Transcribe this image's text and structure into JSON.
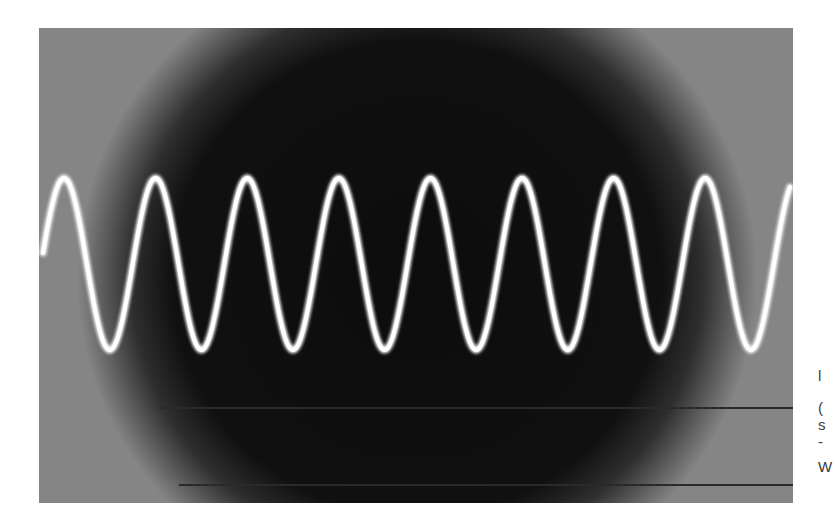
{
  "figure": {
    "type": "oscilloscope-photo",
    "colors": {
      "screen_center": "#0d0d0d",
      "screen_edge": "#828282",
      "trace": "#ffffff",
      "page_bg": "#ffffff"
    },
    "waveform": {
      "cycles_visible": 8.2,
      "period_px": 91.6,
      "peak_y_px": 178,
      "trough_y_px": 350,
      "first_peak_x_px": 64
    }
  },
  "caption_fragments": [
    {
      "text": "l",
      "y": 375
    },
    {
      "text": "(",
      "y": 407
    },
    {
      "text": "s",
      "y": 424
    },
    {
      "text": "-",
      "y": 441
    },
    {
      "text": "W",
      "y": 466
    }
  ]
}
